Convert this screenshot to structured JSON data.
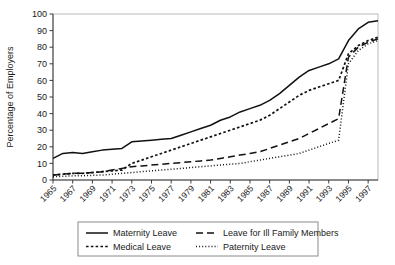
{
  "chart_data": {
    "type": "line",
    "title": "",
    "xlabel": "",
    "ylabel": "Percentage of Employers",
    "ylim": [
      0,
      100
    ],
    "xlim": [
      1965,
      1998
    ],
    "ytick_labels": [
      "0",
      "10",
      "20",
      "30",
      "40",
      "50",
      "60",
      "70",
      "80",
      "90",
      "100"
    ],
    "yticks": [
      0,
      10,
      20,
      30,
      40,
      50,
      60,
      70,
      80,
      90,
      100
    ],
    "xtick_labels": [
      "1965",
      "1967",
      "1969",
      "1971",
      "1973",
      "1975",
      "1977",
      "1979",
      "1981",
      "1983",
      "1985",
      "1987",
      "1989",
      "1991",
      "1993",
      "1995",
      "1997"
    ],
    "xticks": [
      1965,
      1967,
      1969,
      1971,
      1973,
      1975,
      1977,
      1979,
      1981,
      1983,
      1985,
      1987,
      1989,
      1991,
      1993,
      1995,
      1997
    ],
    "grid": false,
    "legend_position": "below-center",
    "x": [
      1965,
      1966,
      1967,
      1968,
      1969,
      1970,
      1971,
      1972,
      1973,
      1974,
      1975,
      1976,
      1977,
      1978,
      1979,
      1980,
      1981,
      1982,
      1983,
      1984,
      1985,
      1986,
      1987,
      1988,
      1989,
      1990,
      1991,
      1992,
      1993,
      1994,
      1995,
      1996,
      1997,
      1998
    ],
    "series": [
      {
        "name": "Maternity Leave",
        "style": "solid",
        "values": [
          13,
          16,
          16.5,
          16,
          17,
          18,
          18.5,
          19,
          23,
          23.5,
          24,
          24.5,
          25,
          27,
          29,
          31,
          33,
          36,
          38,
          41,
          43,
          45,
          48,
          52,
          57,
          62,
          66,
          68,
          70,
          73,
          84,
          91,
          95,
          96
        ]
      },
      {
        "name": "Medical Leave",
        "style": "dotted-square",
        "values": [
          3,
          3.5,
          4,
          4,
          4.5,
          5,
          5.5,
          6,
          10,
          12,
          14,
          16,
          18,
          20,
          22,
          24,
          26,
          28,
          30,
          32,
          34,
          36,
          39,
          43,
          47,
          51,
          54,
          56,
          58,
          60,
          76,
          81,
          84,
          86
        ]
      },
      {
        "name": "Leave for Ill Family Members",
        "style": "dashed",
        "values": [
          3,
          3.5,
          4,
          4,
          4.5,
          5,
          6,
          7,
          8,
          8.5,
          9,
          9.5,
          10,
          10.5,
          11,
          11.5,
          12,
          13,
          14,
          15,
          16,
          17,
          19,
          21,
          23,
          25,
          28,
          31,
          34,
          37,
          74,
          80,
          83,
          85
        ]
      },
      {
        "name": "Paternity Leave",
        "style": "dotted",
        "values": [
          2,
          2.2,
          2.5,
          2.6,
          2.8,
          3,
          3.5,
          4,
          4.5,
          5,
          5.5,
          6,
          6.5,
          7,
          7.5,
          8,
          8.5,
          9,
          9.5,
          10,
          11,
          12,
          13,
          14,
          15,
          16,
          18,
          20,
          22,
          24,
          70,
          78,
          82,
          84
        ]
      }
    ]
  },
  "legend": {
    "entries": [
      {
        "label": "Maternity Leave"
      },
      {
        "label": "Leave for Ill Family Members"
      },
      {
        "label": "Medical Leave"
      },
      {
        "label": "Paternity Leave"
      }
    ]
  }
}
